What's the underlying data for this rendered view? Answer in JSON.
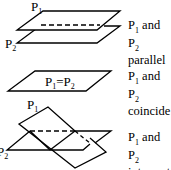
{
  "diagram": {
    "line_color": "#000000",
    "background": "#ffffff",
    "cases": [
      {
        "id": "parallel",
        "plane_labels": [
          {
            "base": "P",
            "sub": "1"
          },
          {
            "base": "P",
            "sub": "2"
          }
        ],
        "caption_line1": {
          "a": "P",
          "a_sub": "1",
          "mid": " and P",
          "b_sub": "2"
        },
        "caption_line2": "parallel"
      },
      {
        "id": "coincide",
        "plane_label": {
          "a": "P",
          "a_sub": "1",
          "eq": "=P",
          "b_sub": "2"
        },
        "caption_line1": {
          "a": "P",
          "a_sub": "1",
          "mid": " and P",
          "b_sub": "2"
        },
        "caption_line2": "coincide"
      },
      {
        "id": "intersect",
        "plane_labels": [
          {
            "base": "P",
            "sub": "1"
          },
          {
            "base": "P",
            "sub": "2"
          }
        ],
        "caption_line1": {
          "a": "P",
          "a_sub": "1",
          "mid": " and P",
          "b_sub": "2"
        },
        "caption_line2": "intersect"
      }
    ]
  }
}
